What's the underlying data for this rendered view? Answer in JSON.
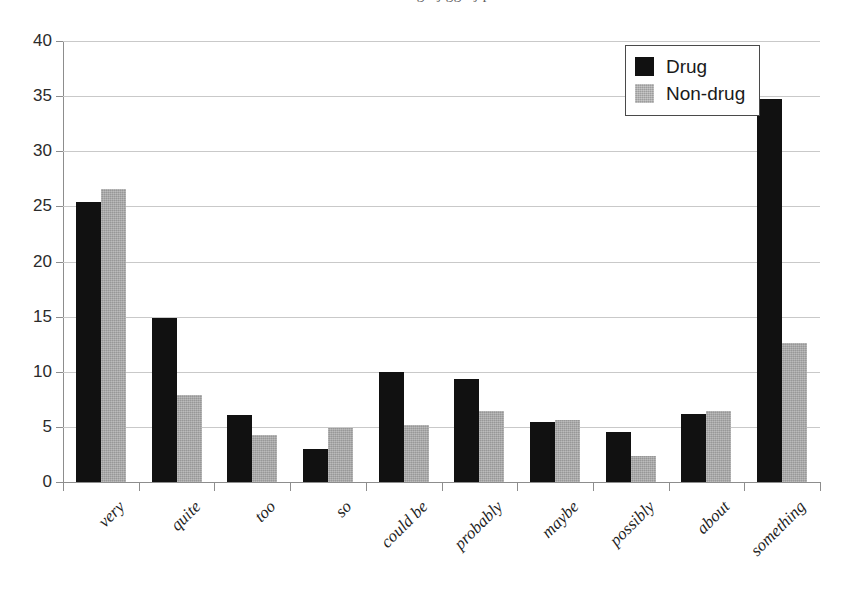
{
  "figure": {
    "caption_remnant": "a bcdefghij gghij p",
    "background_color": "#ffffff"
  },
  "legend": {
    "position": "top-right",
    "entries": [
      {
        "label": "Drug",
        "color": "#111111",
        "swatch_name": "legend-swatch-drug"
      },
      {
        "label": "Non-drug",
        "color": "#a9a9a9",
        "swatch_name": "legend-swatch-nondrug"
      }
    ]
  },
  "axes": {
    "y_ticks": [
      "40",
      "35",
      "30",
      "25",
      "20",
      "15",
      "10",
      "5",
      "0"
    ]
  },
  "chart_data": {
    "type": "bar",
    "title": "",
    "subtitle": "",
    "xlabel": "",
    "ylabel": "",
    "ylim": [
      0,
      40
    ],
    "ytick_step": 5,
    "grid": true,
    "grid_axis": "y",
    "legend_position": "upper right",
    "orientation": "vertical",
    "bar_mode": "grouped",
    "categories": [
      "very",
      "quite",
      "too",
      "so",
      "could be",
      "probably",
      "maybe",
      "possibly",
      "about",
      "something"
    ],
    "series": [
      {
        "name": "Drug",
        "color": "#111111",
        "values": [
          25.4,
          14.9,
          6.1,
          3.0,
          10.0,
          9.3,
          5.4,
          4.5,
          6.2,
          34.7
        ]
      },
      {
        "name": "Non-drug",
        "color": "#a9a9a9",
        "values": [
          26.6,
          7.9,
          4.3,
          4.9,
          5.2,
          6.4,
          5.6,
          2.4,
          6.4,
          12.6
        ]
      }
    ]
  }
}
